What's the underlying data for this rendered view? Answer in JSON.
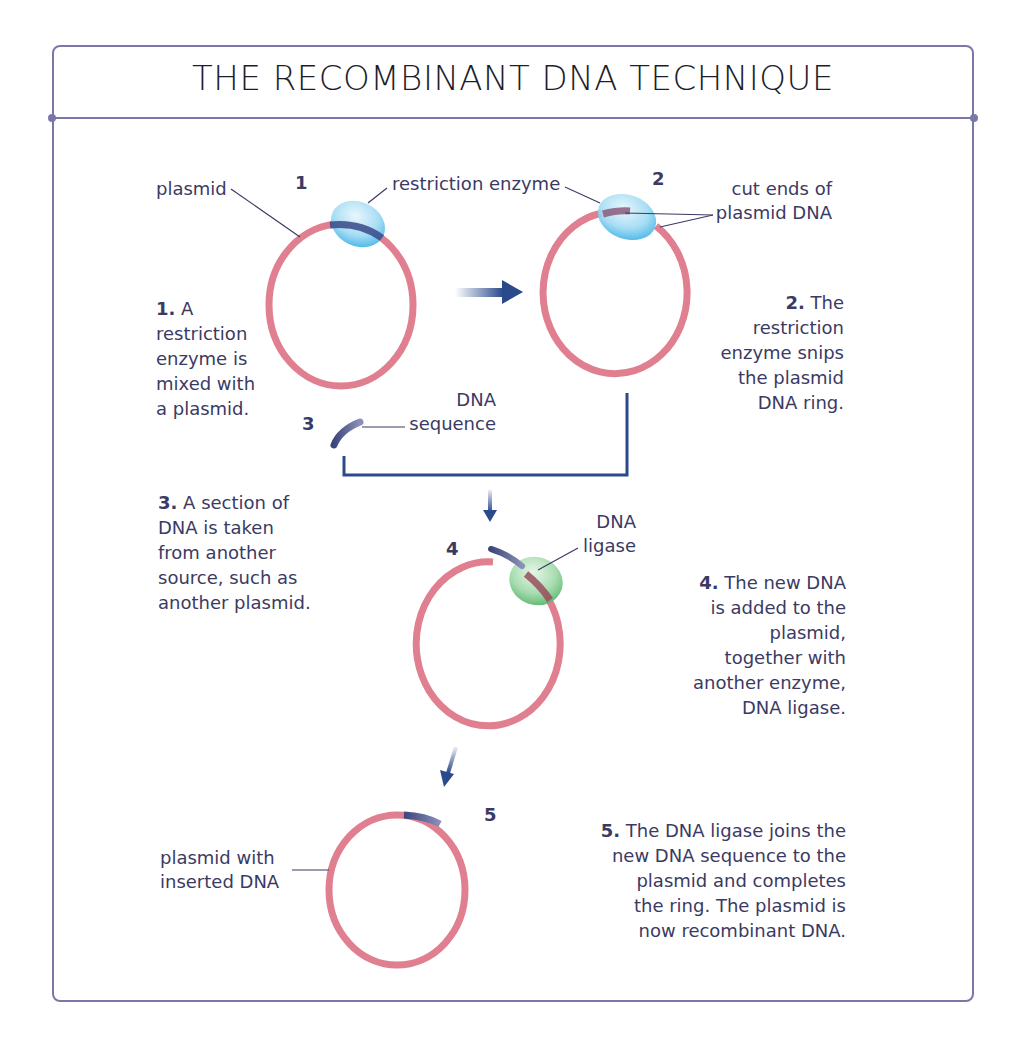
{
  "title": "THE RECOMBINANT DNA TECHNIQUE",
  "colors": {
    "frame": "#7a78a8",
    "plasmid": "#e07f8f",
    "dna_insert": "#4a5488",
    "restriction_enzyme": "#8fd3f0",
    "dna_ligase": "#7fcf8f",
    "arrow": "#2a4a8c",
    "text": "#3b3a63"
  },
  "steps": [
    {
      "number": "1",
      "desc_num": "1.",
      "desc_lines": [
        "A",
        "restriction",
        "enzyme is",
        "mixed with",
        "a plasmid."
      ]
    },
    {
      "number": "2",
      "desc_num": "2.",
      "desc_lines": [
        "The",
        "restriction",
        "enzyme snips",
        "the plasmid",
        "DNA ring."
      ]
    },
    {
      "number": "3",
      "desc_num": "3.",
      "desc_lines": [
        "A section of",
        "DNA is taken",
        "from another",
        "source, such as",
        "another plasmid."
      ]
    },
    {
      "number": "4",
      "desc_num": "4.",
      "desc_lines": [
        "The new DNA",
        "is added to the",
        "plasmid,",
        "together with",
        "another enzyme,",
        "DNA ligase."
      ]
    },
    {
      "number": "5",
      "desc_num": "5.",
      "desc_lines": [
        "The DNA ligase joins the",
        "new DNA sequence to the",
        "plasmid and completes",
        "the ring. The plasmid is",
        "now recombinant DNA."
      ]
    }
  ],
  "labels": {
    "plasmid": "plasmid",
    "restriction_enzyme": "restriction enzyme",
    "cut_ends_line1": "cut ends of",
    "cut_ends_line2": "plasmid DNA",
    "dna_sequence_line1": "DNA",
    "dna_sequence_line2": "sequence",
    "dna_ligase_line1": "DNA",
    "dna_ligase_line2": "ligase",
    "plasmid_inserted_line1": "plasmid with",
    "plasmid_inserted_line2": "inserted DNA"
  }
}
